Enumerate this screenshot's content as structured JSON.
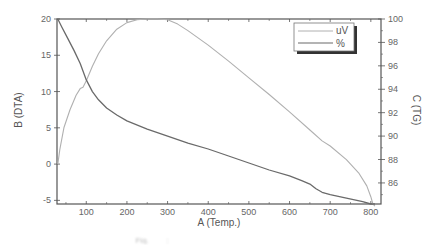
{
  "chart_data": {
    "type": "line",
    "title": "",
    "xlabel": "A (Temp.)",
    "ylabel": "B (DTA)",
    "y2label": "C (TG)",
    "xlim": [
      28,
      825
    ],
    "ylim": [
      -5.5,
      20
    ],
    "y2lim": [
      84.2,
      100
    ],
    "xticks": [
      100,
      200,
      300,
      400,
      500,
      600,
      700,
      800
    ],
    "yticks": [
      -5,
      0,
      5,
      10,
      15,
      20
    ],
    "y2ticks": [
      86,
      88,
      90,
      92,
      94,
      96,
      98,
      100
    ],
    "grid": false,
    "legend_position": "upper right",
    "series": [
      {
        "name": "uV",
        "axis": "left",
        "color": "#b0b0b0",
        "x": [
          30,
          35,
          45,
          60,
          75,
          85,
          92,
          100,
          115,
          130,
          150,
          175,
          200,
          225,
          250,
          275,
          300,
          325,
          350,
          400,
          450,
          500,
          550,
          600,
          650,
          680,
          700,
          740,
          770,
          790,
          800,
          805,
          810
        ],
        "values": [
          0,
          2,
          5,
          7.5,
          9.5,
          10.4,
          10.6,
          11.5,
          13.5,
          15.2,
          17,
          18.6,
          19.5,
          19.9,
          20,
          20,
          19.9,
          19.3,
          18.4,
          16.4,
          14.2,
          11.9,
          9.6,
          7.2,
          4.7,
          3.2,
          2.5,
          0.6,
          -1.2,
          -3,
          -4.5,
          -5.5,
          -5.8
        ]
      },
      {
        "name": "%",
        "axis": "right",
        "color": "#6a6a6a",
        "x": [
          30,
          40,
          55,
          70,
          85,
          100,
          115,
          130,
          150,
          175,
          200,
          250,
          300,
          350,
          400,
          450,
          500,
          550,
          600,
          630,
          650,
          665,
          680,
          700,
          740,
          780,
          800,
          810
        ],
        "values": [
          100,
          99.3,
          98.3,
          97.3,
          96.2,
          94.8,
          93.8,
          93.1,
          92.4,
          91.8,
          91.3,
          90.6,
          90,
          89.4,
          88.9,
          88.3,
          87.7,
          87.1,
          86.6,
          86.2,
          85.9,
          85.5,
          85.2,
          85,
          84.7,
          84.4,
          84.2,
          84.2
        ]
      }
    ]
  },
  "caption_text": "Fig. ___ : ___________ ____ ____ ______ ___"
}
